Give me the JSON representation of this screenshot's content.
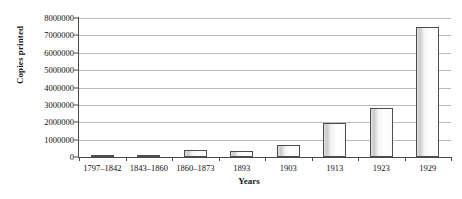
{
  "chart_data": {
    "type": "bar",
    "title": "",
    "xlabel": "Years",
    "ylabel": "Copies printed",
    "categories": [
      "1797–1842",
      "1843–1860",
      "1860–1873",
      "1893",
      "1903",
      "1913",
      "1923",
      "1929"
    ],
    "values": [
      20000,
      100000,
      400000,
      370000,
      700000,
      1950000,
      2800000,
      7500000
    ],
    "ylim": [
      0,
      8000000
    ],
    "yticks": [
      0,
      1000000,
      2000000,
      3000000,
      4000000,
      5000000,
      6000000,
      7000000,
      8000000
    ],
    "ytick_labels": [
      "0",
      "1000000",
      "2000000",
      "3000000",
      "4000000",
      "5000000",
      "6000000",
      "7000000",
      "8000000"
    ],
    "grid": true,
    "legend": "none",
    "bar_color": "#f2f2f2",
    "bar_edge_color": "#4d4d4d",
    "grid_color": "#b9b9b9",
    "axis_color": "#4a4a4a",
    "background": "#ffffff"
  }
}
